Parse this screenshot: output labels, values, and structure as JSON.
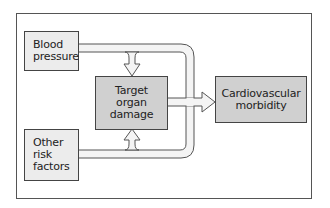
{
  "diagram": {
    "nodes": {
      "blood_pressure": "Blood\npressure",
      "other_risk_factors": "Other\nrisk\nfactors",
      "target_organ_damage": "Target\norgan\ndamage",
      "cardiovascular_morbidity": "Cardiovascular\nmorbidity"
    },
    "edges": [
      {
        "from": "Blood pressure",
        "to": "Target organ damage"
      },
      {
        "from": "Blood pressure",
        "to": "Cardiovascular morbidity"
      },
      {
        "from": "Other risk factors",
        "to": "Target organ damage"
      },
      {
        "from": "Other risk factors",
        "to": "Cardiovascular morbidity"
      },
      {
        "from": "Target organ damage",
        "to": "Cardiovascular morbidity"
      }
    ],
    "colors": {
      "input_box_fill": "#ececec",
      "central_box_fill": "#d0d0d0",
      "arrow_fill": "#f2f2f2",
      "stroke": "#444444"
    }
  }
}
